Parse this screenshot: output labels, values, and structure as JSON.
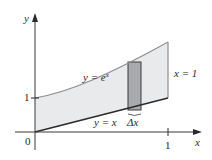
{
  "diagram": {
    "colors": {
      "region_fill": "#e9eaec",
      "strip_fill": "#a9aaae",
      "curve": "#8e8e8e",
      "line": "#2a2a2a",
      "axis": "#3a3a3a",
      "text": "#2a2a2a"
    },
    "axes": {
      "x_label": "x",
      "y_label": "y",
      "origin_label": "0",
      "x_tick_label": "1",
      "y_tick_label": "1"
    },
    "curves": {
      "upper": {
        "lhs": "y = e",
        "exp": "x"
      },
      "lower": {
        "label": "y = x"
      },
      "boundary": {
        "label": "x = 1"
      }
    },
    "strip": {
      "label": "Δx"
    }
  }
}
